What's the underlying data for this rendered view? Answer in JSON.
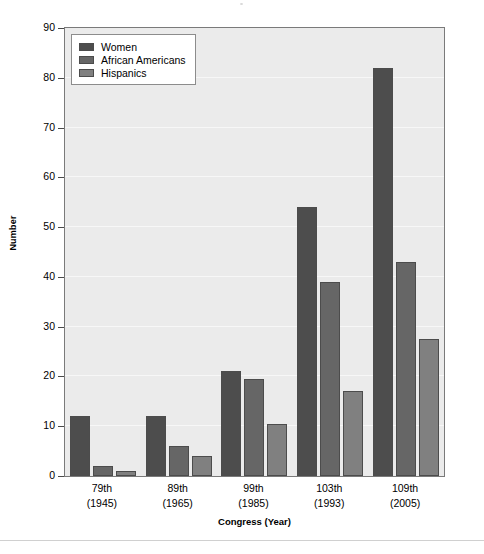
{
  "chart_data": {
    "type": "bar",
    "title": "",
    "xlabel": "Congress (Year)",
    "ylabel": "Number",
    "categories": [
      "79th\n(1945)",
      "89th\n(1965)",
      "99th\n(1985)",
      "103th\n(1993)",
      "109th\n(2005)"
    ],
    "category_lines": [
      {
        "line1": "79th",
        "line2": "(1945)"
      },
      {
        "line1": "89th",
        "line2": "(1965)"
      },
      {
        "line1": "99th",
        "line2": "(1985)"
      },
      {
        "line1": "103th",
        "line2": "(1993)"
      },
      {
        "line1": "109th",
        "line2": "(2005)"
      }
    ],
    "series": [
      {
        "name": "Women",
        "color": "#4d4d4d",
        "values": [
          12,
          12,
          21,
          54,
          82
        ]
      },
      {
        "name": "African Americans",
        "color": "#666666",
        "values": [
          2,
          6,
          19.5,
          39,
          43
        ]
      },
      {
        "name": "Hispanics",
        "color": "#808080",
        "values": [
          1,
          4,
          10.5,
          17,
          27.5
        ]
      }
    ],
    "ylim": [
      0,
      90
    ],
    "yticks": [
      0,
      10,
      20,
      30,
      40,
      50,
      60,
      70,
      80,
      90
    ],
    "ytick_labels": [
      "0",
      "10",
      "20",
      "30",
      "40",
      "50",
      "60",
      "70",
      "80",
      "90"
    ],
    "grid": true,
    "grid_color": "#f7f7f7",
    "legend_position": "upper left",
    "plot_background": "#ebebeb",
    "figure_background": "#ffffff",
    "axis_color": "#7a7a7a",
    "bar_edge_color": "#4c4c4c"
  },
  "legend": {
    "entries": [
      {
        "label": "Women"
      },
      {
        "label": "African Americans"
      },
      {
        "label": "Hispanics"
      }
    ]
  }
}
